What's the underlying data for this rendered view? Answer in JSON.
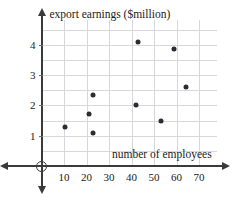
{
  "chart_data": {
    "type": "scatter",
    "title": "",
    "xlabel": "number of employees",
    "ylabel": "export earnings ($million)",
    "xlim": [
      0,
      78
    ],
    "ylim": [
      0,
      4.6
    ],
    "xticks": [
      10,
      20,
      30,
      40,
      50,
      60,
      70
    ],
    "yticks": [
      1,
      2,
      3,
      4
    ],
    "xtick_labels": [
      "10",
      "20",
      "30",
      "40",
      "50",
      "60",
      "70"
    ],
    "ytick_labels": [
      "1",
      "2",
      "3",
      "4"
    ],
    "grid": true,
    "legend": null,
    "origin_label": "O",
    "marker_color": "#2b2b33",
    "axis_color": "#3a3a3a",
    "grid_color": "#d8d8dc",
    "points": [
      {
        "x": 10.5,
        "y": 1.3
      },
      {
        "x": 21.0,
        "y": 1.7
      },
      {
        "x": 23.0,
        "y": 2.35
      },
      {
        "x": 23.0,
        "y": 1.1
      },
      {
        "x": 42.0,
        "y": 2.0
      },
      {
        "x": 43.0,
        "y": 4.1
      },
      {
        "x": 53.0,
        "y": 1.5
      },
      {
        "x": 59.0,
        "y": 3.85
      },
      {
        "x": 64.0,
        "y": 2.6
      }
    ]
  }
}
